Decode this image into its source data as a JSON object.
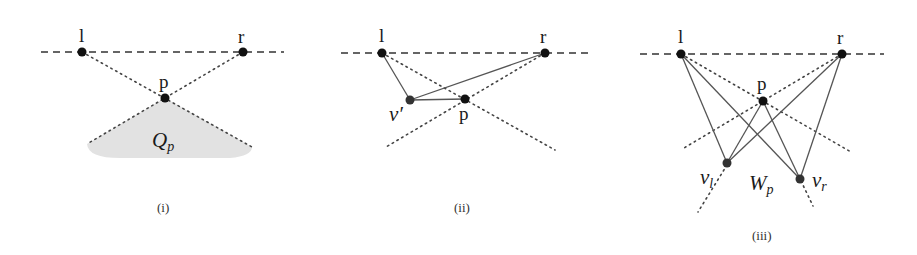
{
  "figure": {
    "panels": [
      {
        "caption": "(i)",
        "points": {
          "l": "l",
          "r": "r",
          "p": "p"
        },
        "region_label": "Q",
        "region_sub": "p"
      },
      {
        "caption": "(ii)",
        "points": {
          "l": "l",
          "r": "r",
          "p": "p",
          "v": "v′"
        }
      },
      {
        "caption": "(iii)",
        "points": {
          "l": "l",
          "r": "r",
          "p": "p"
        },
        "vl_label": "v",
        "vl_sub": "l",
        "vr_label": "v",
        "vr_sub": "r",
        "region_label": "W",
        "region_sub": "p"
      }
    ],
    "colors": {
      "shade": "#e2e2e2",
      "points": "#111111"
    }
  }
}
